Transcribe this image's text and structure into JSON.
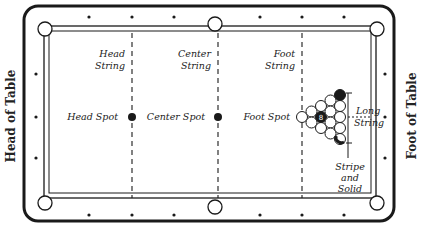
{
  "diagram": {
    "side_labels": {
      "left": "Head of Table",
      "right": "Foot of Table"
    },
    "lines": {
      "head_string": "Head String",
      "center_string": "Center String",
      "foot_string": "Foot String",
      "long_string": "Long String"
    },
    "spots": {
      "head": "Head Spot",
      "center": "Center Spot",
      "foot": "Foot Spot"
    },
    "rack_note": [
      "Stripe",
      "and",
      "Solid"
    ],
    "rack_center_ball": "8",
    "colors": {
      "frame": "#1a1a1a",
      "felt": "#ffffff",
      "ink": "#222222"
    }
  }
}
